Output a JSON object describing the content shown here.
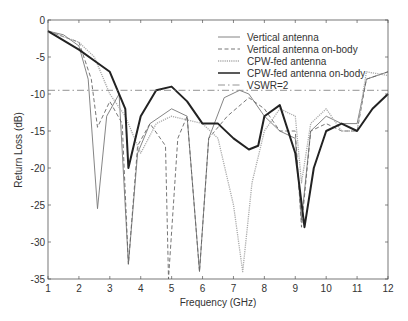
{
  "chart_data": {
    "type": "line",
    "title": "",
    "xlabel": "Frequency (GHz)",
    "ylabel": "Return Loss (dB)",
    "xlim": [
      1,
      12
    ],
    "ylim": [
      -35,
      0
    ],
    "xticks": [
      "1",
      "2",
      "3",
      "4",
      "5",
      "6",
      "7",
      "8",
      "9",
      "10",
      "11",
      "12"
    ],
    "yticks": [
      "0",
      "-5",
      "-10",
      "-15",
      "-20",
      "-25",
      "-30",
      "-35"
    ],
    "grid": false,
    "legend_position": "upper right",
    "series": [
      {
        "name": "Vertical antenna",
        "style": "thin-solid",
        "color": "#777777",
        "x": [
          1,
          1.5,
          2,
          2.3,
          2.6,
          2.9,
          3.3,
          3.6,
          3.9,
          4.3,
          5,
          5.5,
          5.9,
          6.2,
          6.7,
          7.2,
          7.5,
          8,
          8.5,
          9,
          9.2,
          9.5,
          10,
          10.5,
          11,
          11.3,
          12
        ],
        "y": [
          -1.5,
          -2,
          -3.5,
          -8,
          -25.5,
          -13,
          -10,
          -33,
          -18,
          -14,
          -12,
          -13,
          -34,
          -16,
          -10.5,
          -9.5,
          -10,
          -13,
          -15,
          -16,
          -27,
          -15,
          -13,
          -14,
          -14,
          -8,
          -7
        ]
      },
      {
        "name": "Vertical antenna on-body",
        "style": "dashed",
        "color": "#666666",
        "x": [
          1,
          2,
          2.4,
          2.6,
          3,
          3.4,
          3.6,
          3.9,
          4.3,
          4.8,
          4.9,
          5.2,
          5.5,
          5.9,
          6.2,
          6.8,
          7.5,
          8,
          8.5,
          9,
          9.2,
          9.5,
          10,
          10.5,
          11,
          11.3,
          12
        ],
        "y": [
          -1.5,
          -3,
          -8,
          -14.5,
          -11,
          -14,
          -33,
          -17,
          -14,
          -17,
          -35,
          -16,
          -13,
          -34,
          -16,
          -13,
          -10.5,
          -12,
          -15,
          -15,
          -28,
          -15,
          -14,
          -15,
          -15,
          -8,
          -7
        ]
      },
      {
        "name": "CPW-fed antenna",
        "style": "dotted",
        "color": "#aaaaaa",
        "x": [
          1,
          2,
          2.5,
          3,
          3.5,
          4,
          4.5,
          5,
          6,
          6.5,
          7,
          7.3,
          7.6,
          8,
          8.5,
          9,
          9.2,
          9.5,
          10,
          10.5,
          11,
          11.3,
          12
        ],
        "y": [
          -1.5,
          -3,
          -5,
          -10,
          -13,
          -18,
          -14,
          -13,
          -14,
          -16,
          -25,
          -34,
          -22,
          -15,
          -12,
          -13,
          -22,
          -14,
          -12,
          -15,
          -15,
          -7,
          -7.5
        ]
      },
      {
        "name": "CPW-fed antenna on-body",
        "style": "thick-solid",
        "color": "#222222",
        "x": [
          1,
          2,
          2.5,
          3,
          3.5,
          3.6,
          4,
          4.5,
          5,
          5.5,
          6,
          6.5,
          7,
          7.5,
          7.8,
          8,
          8.5,
          9,
          9.3,
          9.6,
          10,
          10.5,
          11,
          11.5,
          12
        ],
        "y": [
          -1.5,
          -4,
          -5.5,
          -7,
          -12,
          -20,
          -13,
          -9.5,
          -9,
          -11,
          -14,
          -14,
          -16,
          -17.5,
          -17,
          -13,
          -11.5,
          -18,
          -28,
          -20,
          -15,
          -14,
          -15,
          -12,
          -10
        ]
      },
      {
        "name": "VSWR=2",
        "style": "dash-dot",
        "color": "#888888",
        "x": [
          1,
          12
        ],
        "y": [
          -9.5,
          -9.5
        ]
      }
    ]
  }
}
